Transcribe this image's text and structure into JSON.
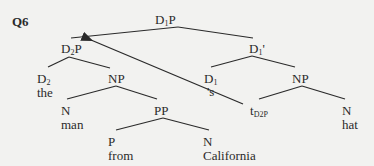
{
  "question_label": "Q6",
  "tree": {
    "root": {
      "cat": "D",
      "sub": "1",
      "bar": "P"
    },
    "specifier": {
      "cat": "D",
      "sub": "2",
      "bar": "P"
    },
    "d1_bar": {
      "cat": "D",
      "sub": "1",
      "bar": "'"
    },
    "d2": {
      "cat": "D",
      "sub": "2",
      "word": "the"
    },
    "np_left": {
      "cat": "NP"
    },
    "n_man": {
      "cat": "N",
      "word": "man"
    },
    "pp": {
      "cat": "PP"
    },
    "p_from": {
      "cat": "P",
      "word": "from"
    },
    "n_california": {
      "cat": "N",
      "word": "California"
    },
    "d1": {
      "cat": "D",
      "sub": "1",
      "word": "'s"
    },
    "np_right": {
      "cat": "NP"
    },
    "trace": {
      "base": "t",
      "sub": "D2P"
    },
    "n_hat": {
      "cat": "N",
      "word": "hat"
    }
  },
  "movement_arrow": {
    "from": "trace",
    "to": "specifier"
  },
  "colors": {
    "lines": "#2a2a2a",
    "background": "#f2f2f0"
  }
}
